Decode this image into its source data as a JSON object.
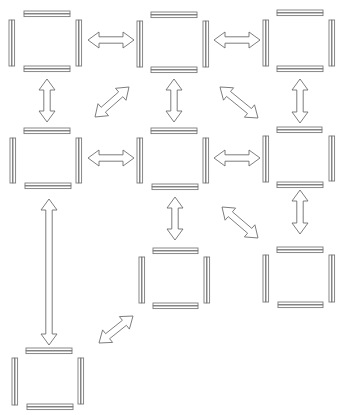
{
  "diagram": {
    "width": 345,
    "height": 415,
    "colors": {
      "background": "#ffffff",
      "bar_stroke": "#7a7a7a",
      "arrow_stroke": "#6e6e6e"
    },
    "bar_style": {
      "pair_gap": 3,
      "bar_thickness": 2.6
    },
    "nodes": [
      {
        "id": "node-1",
        "top": {
          "x1": 24,
          "x2": 70,
          "y": 11
        },
        "bottom": {
          "x1": 24,
          "x2": 70,
          "y": 66
        },
        "left": {
          "x": 9,
          "y1": 20,
          "y2": 66
        },
        "right": {
          "x": 76,
          "y1": 20,
          "y2": 66
        }
      },
      {
        "id": "node-2",
        "top": {
          "x1": 151,
          "x2": 197,
          "y": 12
        },
        "bottom": {
          "x1": 151,
          "x2": 197,
          "y": 67
        },
        "left": {
          "x": 137,
          "y1": 21,
          "y2": 67
        },
        "right": {
          "x": 203,
          "y1": 21,
          "y2": 67
        }
      },
      {
        "id": "node-3",
        "top": {
          "x1": 277,
          "x2": 323,
          "y": 10
        },
        "bottom": {
          "x1": 277,
          "x2": 323,
          "y": 66
        },
        "left": {
          "x": 263,
          "y1": 20,
          "y2": 66
        },
        "right": {
          "x": 329,
          "y1": 20,
          "y2": 66
        }
      },
      {
        "id": "node-4",
        "top": {
          "x1": 24,
          "x2": 70,
          "y": 128
        },
        "bottom": {
          "x1": 25,
          "x2": 71,
          "y": 183
        },
        "left": {
          "x": 10,
          "y1": 138,
          "y2": 183
        },
        "right": {
          "x": 76,
          "y1": 138,
          "y2": 183
        }
      },
      {
        "id": "node-5",
        "top": {
          "x1": 151,
          "x2": 197,
          "y": 128
        },
        "bottom": {
          "x1": 152,
          "x2": 198,
          "y": 184
        },
        "left": {
          "x": 137,
          "y1": 138,
          "y2": 183
        },
        "right": {
          "x": 203,
          "y1": 138,
          "y2": 183
        }
      },
      {
        "id": "node-6",
        "top": {
          "x1": 277,
          "x2": 322,
          "y": 127
        },
        "bottom": {
          "x1": 277,
          "x2": 323,
          "y": 182
        },
        "left": {
          "x": 263,
          "y1": 136,
          "y2": 182
        },
        "right": {
          "x": 329,
          "y1": 136,
          "y2": 181
        }
      },
      {
        "id": "node-7",
        "top": {
          "x1": 153,
          "x2": 198,
          "y": 248
        },
        "bottom": {
          "x1": 153,
          "x2": 198,
          "y": 303
        },
        "left": {
          "x": 139,
          "y1": 257,
          "y2": 303
        },
        "right": {
          "x": 204,
          "y1": 257,
          "y2": 303
        }
      },
      {
        "id": "node-8",
        "top": {
          "x1": 277,
          "x2": 323,
          "y": 247
        },
        "bottom": {
          "x1": 278,
          "x2": 323,
          "y": 302
        },
        "left": {
          "x": 263,
          "y1": 255,
          "y2": 302
        },
        "right": {
          "x": 329,
          "y1": 255,
          "y2": 302
        }
      },
      {
        "id": "node-9",
        "top": {
          "x1": 26,
          "x2": 72,
          "y": 348
        },
        "bottom": {
          "x1": 27,
          "x2": 73,
          "y": 404
        },
        "left": {
          "x": 12,
          "y1": 358,
          "y2": 405
        },
        "right": {
          "x": 78,
          "y1": 358,
          "y2": 404
        }
      }
    ],
    "arrows": [
      {
        "id": "arrow-1-2",
        "from": "node-1",
        "to": "node-2",
        "x1": 88,
        "y1": 40,
        "x2": 134,
        "y2": 40
      },
      {
        "id": "arrow-2-3",
        "from": "node-2",
        "to": "node-3",
        "x1": 214,
        "y1": 40,
        "x2": 260,
        "y2": 40
      },
      {
        "id": "arrow-1-4",
        "from": "node-1",
        "to": "node-4",
        "x1": 47,
        "y1": 79,
        "x2": 47,
        "y2": 122
      },
      {
        "id": "arrow-2-4",
        "from": "node-2",
        "to": "node-4",
        "x1": 129,
        "y1": 87,
        "x2": 95,
        "y2": 117
      },
      {
        "id": "arrow-2-5",
        "from": "node-2",
        "to": "node-5",
        "x1": 174,
        "y1": 79,
        "x2": 174,
        "y2": 122
      },
      {
        "id": "arrow-2-6",
        "from": "node-2",
        "to": "node-6",
        "x1": 220,
        "y1": 87,
        "x2": 258,
        "y2": 118
      },
      {
        "id": "arrow-3-6",
        "from": "node-3",
        "to": "node-6",
        "x1": 300,
        "y1": 79,
        "x2": 300,
        "y2": 123
      },
      {
        "id": "arrow-4-5",
        "from": "node-4",
        "to": "node-5",
        "x1": 88,
        "y1": 158,
        "x2": 134,
        "y2": 158
      },
      {
        "id": "arrow-5-6",
        "from": "node-5",
        "to": "node-6",
        "x1": 214,
        "y1": 158,
        "x2": 260,
        "y2": 158
      },
      {
        "id": "arrow-4-9",
        "from": "node-4",
        "to": "node-9",
        "x1": 49,
        "y1": 199,
        "x2": 49,
        "y2": 345
      },
      {
        "id": "arrow-5-7",
        "from": "node-5",
        "to": "node-7",
        "x1": 175,
        "y1": 197,
        "x2": 175,
        "y2": 240
      },
      {
        "id": "arrow-5-8",
        "from": "node-5",
        "to": "node-8",
        "x1": 222,
        "y1": 207,
        "x2": 258,
        "y2": 238
      },
      {
        "id": "arrow-6-8",
        "from": "node-6",
        "to": "node-8",
        "x1": 300,
        "y1": 190,
        "x2": 300,
        "y2": 234
      },
      {
        "id": "arrow-7-9",
        "from": "node-7",
        "to": "node-9",
        "x1": 133,
        "y1": 316,
        "x2": 99,
        "y2": 343
      }
    ],
    "arrow_style": {
      "head_length": 11,
      "head_half_width": 8,
      "shaft_half_width": 3.2,
      "double_headed": true
    }
  }
}
